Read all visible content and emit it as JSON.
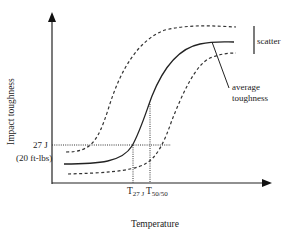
{
  "diagram": {
    "type": "ductile-brittle transition curve",
    "y_axis_label": "Impact toughness",
    "x_axis_label": "Temperature",
    "threshold_value": "27 J",
    "threshold_value_alt": "(20 ft-lbs)",
    "t27j_label": {
      "main": "T",
      "sub": "27 J"
    },
    "t5050_label": {
      "main": "T",
      "sub": "50/50"
    },
    "scatter_label": "scatter",
    "average_label_line1": "average",
    "average_label_line2": "toughness",
    "colors": {
      "line": "#222222",
      "background": "#ffffff"
    }
  }
}
